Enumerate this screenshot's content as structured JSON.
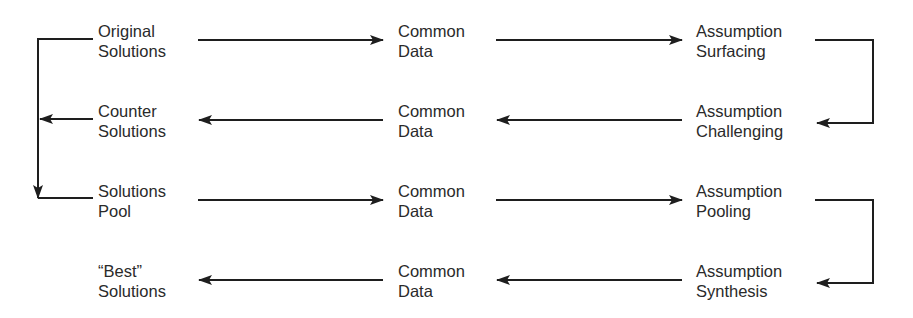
{
  "diagram": {
    "type": "flow",
    "rows": [
      {
        "direction": "right",
        "nodes": [
          {
            "line1": "Original",
            "line2": "Solutions"
          },
          {
            "line1": "Common",
            "line2": "Data"
          },
          {
            "line1": "Assumption",
            "line2": "Surfacing"
          }
        ]
      },
      {
        "direction": "left",
        "nodes": [
          {
            "line1": "Counter",
            "line2": "Solutions"
          },
          {
            "line1": "Common",
            "line2": "Data"
          },
          {
            "line1": "Assumption",
            "line2": "Challenging"
          }
        ]
      },
      {
        "direction": "right",
        "nodes": [
          {
            "line1": "Solutions",
            "line2": "Pool"
          },
          {
            "line1": "Common",
            "line2": "Data"
          },
          {
            "line1": "Assumption",
            "line2": "Pooling"
          }
        ]
      },
      {
        "direction": "left",
        "nodes": [
          {
            "line1": "“Best”",
            "line2": "Solutions"
          },
          {
            "line1": "Common",
            "line2": "Data"
          },
          {
            "line1": "Assumption",
            "line2": "Synthesis"
          }
        ]
      }
    ],
    "connectors": [
      {
        "from": "Original Solutions",
        "to": "Common Data"
      },
      {
        "from": "Common Data",
        "to": "Assumption Surfacing"
      },
      {
        "from": "Assumption Surfacing",
        "to": "Assumption Challenging"
      },
      {
        "from": "Assumption Challenging",
        "to": "Common Data"
      },
      {
        "from": "Common Data",
        "to": "Counter Solutions"
      },
      {
        "from": "Original Solutions",
        "to": "Solutions Pool"
      },
      {
        "from": "Counter Solutions",
        "to": "Solutions Pool"
      },
      {
        "from": "Solutions Pool",
        "to": "Common Data"
      },
      {
        "from": "Common Data",
        "to": "Assumption Pooling"
      },
      {
        "from": "Assumption Pooling",
        "to": "Assumption Synthesis"
      },
      {
        "from": "Assumption Synthesis",
        "to": "Common Data"
      },
      {
        "from": "Common Data",
        "to": "“Best” Solutions"
      }
    ],
    "colors": {
      "line": "#1e1e1e",
      "text": "#2a2a2a",
      "background": "#ffffff"
    }
  }
}
